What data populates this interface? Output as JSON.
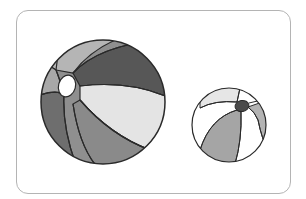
{
  "image": {
    "description": "Illustration of two striped beach balls of different sizes inside a rounded frame",
    "colors": {
      "frame": "#b4b4b4",
      "outline": "#2a2a2a",
      "dark_gray": "#5a5a5a",
      "mid_gray": "#8f8f8f",
      "light_gray": "#b5b5b5",
      "very_light": "#e6e6e6",
      "white": "#ffffff"
    },
    "balls": [
      {
        "name": "large-ball",
        "cx": 103,
        "cy": 102,
        "r": 62
      },
      {
        "name": "small-ball",
        "cx": 229,
        "cy": 125,
        "r": 37
      }
    ]
  }
}
